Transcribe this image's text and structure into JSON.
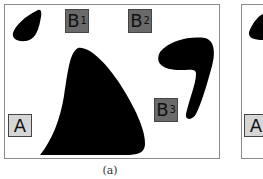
{
  "figure": {
    "panels": [
      {
        "caption": "(a)",
        "labels": [
          {
            "id": "A",
            "text": "A",
            "sub": "",
            "fill": "#d6d6d6"
          },
          {
            "id": "B1",
            "text": "B",
            "sub": "1",
            "fill": "#6a6a6a"
          },
          {
            "id": "B2",
            "text": "B",
            "sub": "2",
            "fill": "#6a6a6a"
          },
          {
            "id": "B3",
            "text": "B",
            "sub": "3",
            "fill": "#6a6a6a"
          }
        ],
        "shapes": [
          "small-blob-top-left",
          "large-triangular-blob-center",
          "hook-blob-right"
        ]
      },
      {
        "caption": "",
        "labels": [
          {
            "id": "A",
            "text": "A",
            "sub": "",
            "fill": "#d6d6d6"
          }
        ],
        "shapes": [
          "small-blob-top-left"
        ]
      }
    ],
    "colors": {
      "shape": "#000000",
      "frame": "#8a8a8a",
      "background": "#ffffff"
    }
  }
}
